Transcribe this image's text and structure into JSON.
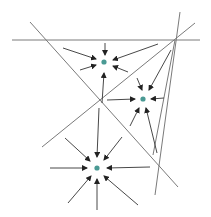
{
  "colors": {
    "background": "#ffffff",
    "line": "#7a7a7a",
    "arrow": "#333333",
    "point": "#4a9a94"
  },
  "diagram": {
    "lines": [
      {
        "x1": 12,
        "y1": 40,
        "x2": 200,
        "y2": 40
      },
      {
        "x1": 30,
        "y1": 22,
        "x2": 178,
        "y2": 187
      },
      {
        "x1": 42,
        "y1": 147,
        "x2": 195,
        "y2": 23
      },
      {
        "x1": 180,
        "y1": 12,
        "x2": 155,
        "y2": 195
      },
      {
        "x1": 175,
        "y1": 40,
        "x2": 153,
        "y2": 155
      }
    ],
    "points": [
      {
        "name": "point-top",
        "cx": 104,
        "cy": 62
      },
      {
        "name": "point-right",
        "cx": 143,
        "cy": 99
      },
      {
        "name": "point-bottom",
        "cx": 97,
        "cy": 168
      }
    ],
    "arrows": [
      {
        "x1": 105,
        "y1": 43,
        "x2": 105,
        "y2": 55
      },
      {
        "x1": 63,
        "y1": 48,
        "x2": 96,
        "y2": 59
      },
      {
        "x1": 158,
        "y1": 44,
        "x2": 113,
        "y2": 60
      },
      {
        "x1": 80,
        "y1": 70,
        "x2": 96,
        "y2": 65
      },
      {
        "x1": 128,
        "y1": 72,
        "x2": 113,
        "y2": 66
      },
      {
        "x1": 102,
        "y1": 103,
        "x2": 104,
        "y2": 73
      },
      {
        "x1": 137,
        "y1": 78,
        "x2": 142,
        "y2": 90
      },
      {
        "x1": 171,
        "y1": 50,
        "x2": 149,
        "y2": 90
      },
      {
        "x1": 164,
        "y1": 98,
        "x2": 151,
        "y2": 99
      },
      {
        "x1": 107,
        "y1": 100,
        "x2": 135,
        "y2": 99
      },
      {
        "x1": 130,
        "y1": 126,
        "x2": 139,
        "y2": 108
      },
      {
        "x1": 157,
        "y1": 153,
        "x2": 146,
        "y2": 108
      },
      {
        "x1": 99,
        "y1": 108,
        "x2": 97,
        "y2": 157
      },
      {
        "x1": 65,
        "y1": 138,
        "x2": 90,
        "y2": 161
      },
      {
        "x1": 122,
        "y1": 137,
        "x2": 104,
        "y2": 160
      },
      {
        "x1": 50,
        "y1": 168,
        "x2": 87,
        "y2": 168
      },
      {
        "x1": 150,
        "y1": 167,
        "x2": 107,
        "y2": 168
      },
      {
        "x1": 68,
        "y1": 203,
        "x2": 91,
        "y2": 176
      },
      {
        "x1": 97,
        "y1": 210,
        "x2": 97,
        "y2": 179
      },
      {
        "x1": 138,
        "y1": 205,
        "x2": 104,
        "y2": 176
      }
    ]
  }
}
